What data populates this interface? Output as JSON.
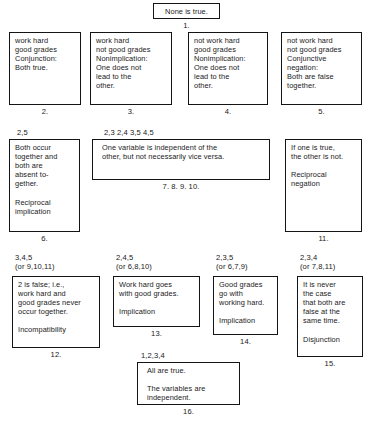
{
  "figure": {
    "type": "logic-relations-diagram",
    "nodes": [
      {
        "id": "1",
        "number": "1.",
        "tag": "",
        "text": "None is true."
      },
      {
        "id": "2",
        "number": "2.",
        "tag": "",
        "text": "work hard\ngood grades\nConjunction:\nBoth true."
      },
      {
        "id": "3",
        "number": "3.",
        "tag": "",
        "text": "work hard\nnot good grades\nNonimplication:\nOne does not\nlead to the\nother."
      },
      {
        "id": "4",
        "number": "4.",
        "tag": "",
        "text": "not work hard\ngood grades\nNonimplication:\nOne does not\nlead to the\nother."
      },
      {
        "id": "5",
        "number": "5.",
        "tag": "",
        "text": "not work hard\nnot good grades\nConjunctive\nnegation:\nBoth are false\ntogether."
      },
      {
        "id": "6",
        "number": "6.",
        "tag": "2,5",
        "text": "Both occur\ntogether and\nboth are\nabsent to-\ngether.\n\nReciprocal\nimplication"
      },
      {
        "id": "7-10",
        "number": "7.        8.        9.        10.",
        "tag": "2,3   2,4   3,5   4,5",
        "text": "One variable is independent of the\nother, but not necessarily vice versa."
      },
      {
        "id": "11",
        "number": "11.",
        "tag": "",
        "text": "If one is true,\nthe other is not.\n\nReciprocal\nnegation"
      },
      {
        "id": "12",
        "number": "12.",
        "tag": "3,4,5\n(or 9,10,11)",
        "text": "2 is false; i.e.,\nwork hard and\ngood grades never\noccur together.\n\nIncompatibility"
      },
      {
        "id": "13",
        "number": "13.",
        "tag": "2,4,5\n(or 6,8,10)",
        "text": "Work hard goes\nwith good grades.\n\nImplication"
      },
      {
        "id": "14",
        "number": "14.",
        "tag": "2,3,5\n(or 6,7,9)",
        "text": "Good grades\ngo with\nworking hard.\n\nImplication"
      },
      {
        "id": "15",
        "number": "15.",
        "tag": "2,3,4\n(or 7,8,11)",
        "text": "It is never\nthe case\nthat both are\nfalse at the\nsame time.\n\nDisjunction"
      },
      {
        "id": "16",
        "number": "16.",
        "tag": "1,2,3,4",
        "text": "All are true.\n\nThe variables are\nindependent."
      }
    ]
  }
}
